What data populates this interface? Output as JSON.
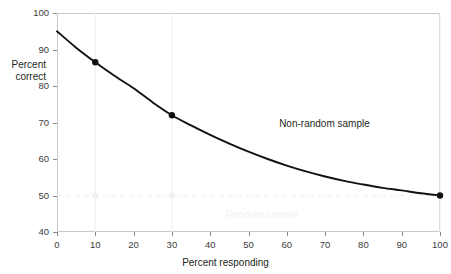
{
  "chart_data": {
    "type": "line",
    "title": "",
    "subtitle": "",
    "xlabel": "Percent responding",
    "ylabel_line1": "Percent",
    "ylabel_line2": "correct",
    "ylabel": "Percent correct",
    "xlim": [
      0,
      100
    ],
    "ylim": [
      40,
      100
    ],
    "xticks": [
      0,
      10,
      20,
      30,
      40,
      50,
      60,
      70,
      80,
      90,
      100
    ],
    "yticks": [
      40,
      50,
      60,
      70,
      80,
      90,
      100
    ],
    "xtick_labels": [
      "0",
      "10",
      "20",
      "30",
      "40",
      "50",
      "60",
      "70",
      "80",
      "90",
      "100"
    ],
    "ytick_labels": [
      "40",
      "50",
      "60",
      "70",
      "80",
      "90",
      "100"
    ],
    "grid": "faint vertical gridlines at x=10, 30, 100; faint dashed horizontal line at y=50",
    "legend": "none (inline annotations)",
    "legend_position": "inline",
    "series": [
      {
        "name": "Non-random sample",
        "style": "solid black curve with filled black circular markers",
        "color": "#111111",
        "annotation": "Non-random sample",
        "annotation_x": 58,
        "annotation_y": 71,
        "x": [
          0,
          5,
          10,
          15,
          20,
          25,
          30,
          35,
          40,
          45,
          50,
          55,
          60,
          65,
          70,
          75,
          80,
          85,
          90,
          95,
          100
        ],
        "y": [
          95.0,
          90.5,
          86.5,
          82.8,
          79.4,
          75.5,
          72.0,
          69.2,
          66.6,
          64.2,
          62.0,
          60.0,
          58.2,
          56.6,
          55.2,
          54.0,
          53.0,
          52.1,
          51.4,
          50.6,
          50.0
        ],
        "markers": [
          {
            "x": 10,
            "y": 86.5
          },
          {
            "x": 30,
            "y": 72.0
          },
          {
            "x": 100,
            "y": 50.0
          }
        ]
      },
      {
        "name": "Random sample",
        "style": "faint light-gray dashed horizontal line with light-gray circular markers",
        "color": "#f0f0f0",
        "annotation": "Random sample",
        "annotation_x": 44,
        "annotation_y": 46,
        "x": [
          0,
          100
        ],
        "y": [
          50,
          50
        ],
        "markers": [
          {
            "x": 10,
            "y": 50
          },
          {
            "x": 30,
            "y": 50
          },
          {
            "x": 100,
            "y": 50
          }
        ]
      }
    ],
    "colors": {
      "curve": "#111111",
      "marker": "#111111",
      "faint": "#f0f0f0",
      "frame": "#c9c9c9",
      "tick_text": "#3b3b3b",
      "label_text": "#231f20",
      "background": "#ffffff"
    }
  }
}
